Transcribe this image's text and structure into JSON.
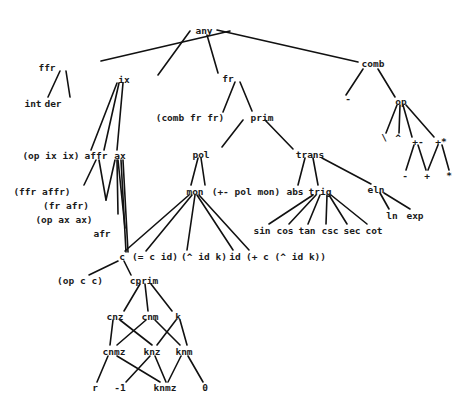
{
  "diagram": {
    "type": "tree",
    "line_color": "#111111",
    "text_color": "#1a1a1a",
    "nodes": [
      {
        "id": "any",
        "label": "any",
        "x": 204,
        "y": 30
      },
      {
        "id": "ffr",
        "label": "ffr",
        "x": 47,
        "y": 67
      },
      {
        "id": "int",
        "label": "int",
        "x": 33,
        "y": 103
      },
      {
        "id": "der",
        "label": "der",
        "x": 53,
        "y": 103
      },
      {
        "id": "ix",
        "label": "ix",
        "x": 124,
        "y": 79
      },
      {
        "id": "fr",
        "label": "fr",
        "x": 228,
        "y": 78
      },
      {
        "id": "combfrfr",
        "label": "(comb fr fr)",
        "x": 190,
        "y": 117
      },
      {
        "id": "prim",
        "label": "prim",
        "x": 262,
        "y": 117
      },
      {
        "id": "comb",
        "label": "comb",
        "x": 373,
        "y": 63
      },
      {
        "id": "minus1",
        "label": "-",
        "x": 348,
        "y": 98
      },
      {
        "id": "op",
        "label": "op",
        "x": 401,
        "y": 101
      },
      {
        "id": "backslash",
        "label": "\\",
        "x": 384,
        "y": 137
      },
      {
        "id": "caret",
        "label": "^",
        "x": 398,
        "y": 137
      },
      {
        "id": "plusminus",
        "label": "+-",
        "x": 418,
        "y": 141
      },
      {
        "id": "plusstar",
        "label": "+*",
        "x": 441,
        "y": 141
      },
      {
        "id": "minus2",
        "label": "-",
        "x": 405,
        "y": 175
      },
      {
        "id": "plus",
        "label": "+",
        "x": 427,
        "y": 175
      },
      {
        "id": "star",
        "label": "*",
        "x": 449,
        "y": 175
      },
      {
        "id": "opixix",
        "label": "(op ix ix)",
        "x": 51,
        "y": 155
      },
      {
        "id": "affr",
        "label": "affr",
        "x": 96,
        "y": 155
      },
      {
        "id": "ax",
        "label": "ax",
        "x": 120,
        "y": 155
      },
      {
        "id": "ffraffr",
        "label": "(ffr affr)",
        "x": 42,
        "y": 191
      },
      {
        "id": "frafr",
        "label": "(fr afr)",
        "x": 66,
        "y": 205
      },
      {
        "id": "opaxax",
        "label": "(op ax ax)",
        "x": 64,
        "y": 219
      },
      {
        "id": "afr",
        "label": "afr",
        "x": 102,
        "y": 233
      },
      {
        "id": "pol",
        "label": "pol",
        "x": 201,
        "y": 154
      },
      {
        "id": "trans",
        "label": "trans",
        "x": 310,
        "y": 154
      },
      {
        "id": "mon",
        "label": "mon",
        "x": 195,
        "y": 191
      },
      {
        "id": "pmpolmon",
        "label": "(+- pol mon)",
        "x": 246,
        "y": 191
      },
      {
        "id": "abs",
        "label": "abs",
        "x": 295,
        "y": 191
      },
      {
        "id": "trig",
        "label": "trig",
        "x": 320,
        "y": 191
      },
      {
        "id": "eln",
        "label": "eln",
        "x": 376,
        "y": 189
      },
      {
        "id": "ln",
        "label": "ln",
        "x": 392,
        "y": 215
      },
      {
        "id": "exp",
        "label": "exp",
        "x": 415,
        "y": 215
      },
      {
        "id": "sin",
        "label": "sin",
        "x": 262,
        "y": 230
      },
      {
        "id": "cos",
        "label": "cos",
        "x": 285,
        "y": 230
      },
      {
        "id": "tan",
        "label": "tan",
        "x": 307,
        "y": 230
      },
      {
        "id": "csc",
        "label": "csc",
        "x": 330,
        "y": 230
      },
      {
        "id": "sec",
        "label": "sec",
        "x": 352,
        "y": 230
      },
      {
        "id": "cot",
        "label": "cot",
        "x": 374,
        "y": 230
      },
      {
        "id": "c",
        "label": "c",
        "x": 122,
        "y": 256
      },
      {
        "id": "eqcid",
        "label": "(= c id)",
        "x": 155,
        "y": 256
      },
      {
        "id": "caretidk",
        "label": "(^ id k)",
        "x": 204,
        "y": 256
      },
      {
        "id": "id",
        "label": "id",
        "x": 235,
        "y": 256
      },
      {
        "id": "pluscaret",
        "label": "(+ c (^ id k))",
        "x": 286,
        "y": 256
      },
      {
        "id": "opcc",
        "label": "(op c c)",
        "x": 80,
        "y": 280
      },
      {
        "id": "cprim",
        "label": "cprim",
        "x": 144,
        "y": 280
      },
      {
        "id": "cnz",
        "label": "cnz",
        "x": 115,
        "y": 316
      },
      {
        "id": "cnm",
        "label": "cnm",
        "x": 150,
        "y": 316
      },
      {
        "id": "k",
        "label": "k",
        "x": 178,
        "y": 316
      },
      {
        "id": "cnmz",
        "label": "cnmz",
        "x": 114,
        "y": 351
      },
      {
        "id": "knz",
        "label": "knz",
        "x": 152,
        "y": 351
      },
      {
        "id": "knm",
        "label": "knm",
        "x": 184,
        "y": 351
      },
      {
        "id": "r",
        "label": "r",
        "x": 95,
        "y": 387
      },
      {
        "id": "neg1",
        "label": "-1",
        "x": 120,
        "y": 387
      },
      {
        "id": "knmz",
        "label": "knmz",
        "x": 165,
        "y": 387
      },
      {
        "id": "zero",
        "label": "0",
        "x": 205,
        "y": 387
      }
    ],
    "edges": [
      [
        230,
        31,
        101,
        61
      ],
      [
        190,
        31,
        158,
        75
      ],
      [
        207,
        35,
        218,
        73
      ],
      [
        217,
        30,
        358,
        62
      ],
      [
        60,
        71,
        48,
        97
      ],
      [
        66,
        71,
        70,
        97
      ],
      [
        117,
        83,
        91,
        150
      ],
      [
        119,
        83,
        104,
        150
      ],
      [
        123,
        83,
        117,
        150
      ],
      [
        235,
        82,
        223,
        112
      ],
      [
        240,
        82,
        252,
        111
      ],
      [
        363,
        69,
        346,
        95
      ],
      [
        378,
        69,
        395,
        97
      ],
      [
        397,
        105,
        386,
        133
      ],
      [
        400,
        105,
        399,
        133
      ],
      [
        403,
        105,
        412,
        137
      ],
      [
        406,
        105,
        434,
        137
      ],
      [
        414,
        145,
        406,
        170
      ],
      [
        418,
        145,
        426,
        170
      ],
      [
        438,
        145,
        428,
        170
      ],
      [
        442,
        145,
        449,
        170
      ],
      [
        96,
        160,
        84,
        185
      ],
      [
        99,
        160,
        106,
        200
      ],
      [
        115,
        160,
        106,
        200
      ],
      [
        117,
        160,
        118,
        214
      ],
      [
        118,
        160,
        125,
        228
      ],
      [
        121,
        160,
        126,
        252
      ],
      [
        123,
        160,
        128,
        252
      ],
      [
        243,
        120,
        222,
        147
      ],
      [
        265,
        120,
        293,
        149
      ],
      [
        198,
        158,
        191,
        185
      ],
      [
        201,
        158,
        205,
        185
      ],
      [
        305,
        158,
        298,
        185
      ],
      [
        313,
        158,
        318,
        185
      ],
      [
        322,
        158,
        371,
        184
      ],
      [
        380,
        193,
        389,
        209
      ],
      [
        384,
        193,
        410,
        209
      ],
      [
        313,
        195,
        269,
        224
      ],
      [
        316,
        195,
        289,
        224
      ],
      [
        320,
        195,
        308,
        224
      ],
      [
        327,
        195,
        326,
        224
      ],
      [
        329,
        195,
        347,
        224
      ],
      [
        331,
        195,
        367,
        224
      ],
      [
        189,
        195,
        125,
        251
      ],
      [
        192,
        195,
        146,
        251
      ],
      [
        195,
        195,
        187,
        250
      ],
      [
        197,
        195,
        233,
        250
      ],
      [
        199,
        195,
        249,
        250
      ],
      [
        118,
        261,
        89,
        275
      ],
      [
        124,
        261,
        131,
        275
      ],
      [
        140,
        284,
        124,
        311
      ],
      [
        145,
        284,
        148,
        311
      ],
      [
        151,
        284,
        172,
        311
      ],
      [
        113,
        320,
        110,
        345
      ],
      [
        120,
        320,
        152,
        345
      ],
      [
        146,
        320,
        117,
        345
      ],
      [
        155,
        320,
        180,
        345
      ],
      [
        176,
        320,
        157,
        345
      ],
      [
        180,
        320,
        187,
        345
      ],
      [
        108,
        356,
        97,
        382
      ],
      [
        117,
        356,
        160,
        382
      ],
      [
        150,
        356,
        126,
        382
      ],
      [
        155,
        356,
        166,
        382
      ],
      [
        181,
        356,
        168,
        382
      ],
      [
        188,
        356,
        203,
        382
      ]
    ]
  }
}
